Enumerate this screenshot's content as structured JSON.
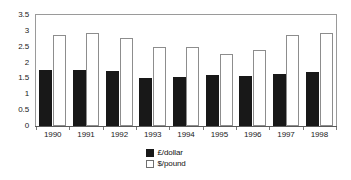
{
  "chart_data": {
    "type": "bar",
    "title": "",
    "subtitle": "",
    "xlabel": "",
    "ylabel": "",
    "categories": [
      "1990",
      "1991",
      "1992",
      "1993",
      "1994",
      "1995",
      "1996",
      "1997",
      "1998"
    ],
    "series": [
      {
        "name": "£/dollar",
        "color": "#181818",
        "style": "filled",
        "values": [
          1.78,
          1.76,
          1.75,
          1.5,
          1.53,
          1.6,
          1.57,
          1.65,
          1.69
        ]
      },
      {
        "name": "$/pound",
        "color": "#ffffff",
        "style": "outlined",
        "values": [
          2.87,
          2.93,
          2.76,
          2.5,
          2.5,
          2.28,
          2.41,
          2.87,
          2.93
        ]
      }
    ],
    "ylim": [
      0,
      3.5
    ],
    "y_ticks": [
      "0",
      "0.5",
      "1",
      "1.5",
      "2",
      "2.5",
      "3",
      "3.5"
    ],
    "y_tick_values": [
      0,
      0.5,
      1,
      1.5,
      2,
      2.5,
      3,
      3.5
    ],
    "grid": false,
    "legend_position": "bottom-center",
    "legend": [
      "£/dollar",
      "$/pound"
    ]
  }
}
